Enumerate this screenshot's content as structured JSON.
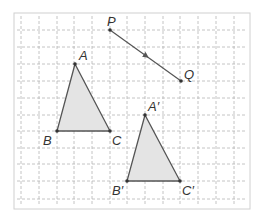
{
  "diagram": {
    "type": "translation",
    "frame": {
      "x": 14,
      "y": 13,
      "width": 236,
      "height": 196,
      "stroke": "#d0d0d0"
    },
    "grid": {
      "x_lines": [
        21,
        39,
        57,
        74,
        92,
        110,
        127,
        145,
        163,
        180,
        198,
        216,
        234
      ],
      "y_lines": [
        30,
        47,
        64,
        81,
        98,
        115,
        131,
        148,
        164,
        181,
        199
      ],
      "color": "#b5b5b5",
      "dash": "3,2"
    },
    "colors": {
      "edge": "#555555",
      "fill": "#e4e4e4",
      "point": "#333333",
      "label": "#333333"
    },
    "vector": {
      "from": {
        "label": "P",
        "x": 110,
        "y": 30
      },
      "to": {
        "label": "Q",
        "x": 181,
        "y": 81
      }
    },
    "triangle_original": {
      "A": {
        "label": "A",
        "x": 75,
        "y": 64
      },
      "B": {
        "label": "B",
        "x": 57,
        "y": 131
      },
      "C": {
        "label": "C",
        "x": 110,
        "y": 131
      }
    },
    "triangle_image": {
      "A": {
        "label": "A′",
        "x": 145,
        "y": 115
      },
      "B": {
        "label": "B′",
        "x": 127,
        "y": 181
      },
      "C": {
        "label": "C′",
        "x": 180,
        "y": 181
      }
    },
    "labels": {
      "P": "P",
      "Q": "Q",
      "A": "A",
      "B": "B",
      "C": "C",
      "A_prime": "A′",
      "B_prime": "B′",
      "C_prime": "C′"
    }
  }
}
